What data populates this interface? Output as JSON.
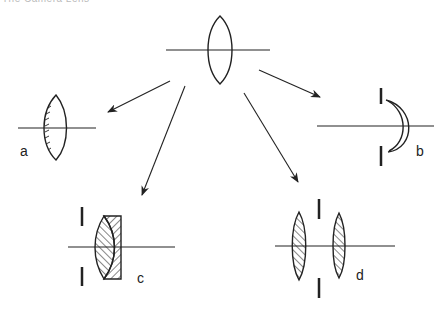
{
  "header": {
    "text": "The Camera Lens"
  },
  "diagram": {
    "central_lens": {
      "name": "simple biconvex lens"
    },
    "variants": [
      {
        "id": "a",
        "label": "a",
        "description": "plano-convex / half-shaded single lens"
      },
      {
        "id": "b",
        "label": "b",
        "description": "meniscus lens with aperture stop"
      },
      {
        "id": "c",
        "label": "c",
        "description": "cemented doublet with aperture stop"
      },
      {
        "id": "d",
        "label": "d",
        "description": "two separated lenses with central stop"
      }
    ],
    "colors": {
      "stroke": "#222222",
      "background": "#ffffff"
    }
  }
}
